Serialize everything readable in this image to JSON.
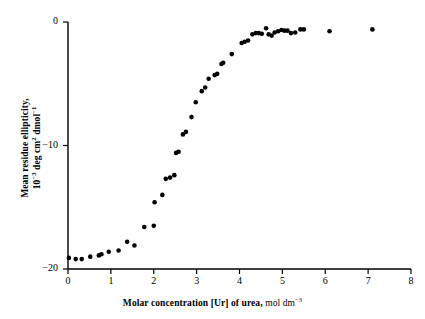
{
  "chart_data": {
    "type": "scatter",
    "title": "",
    "xlabel": "Molar concentration [Ur] of urea, mol dm-3",
    "xlabel_parts": {
      "bold": "Molar concentration [Ur] of urea,",
      "light_pre": " mol dm",
      "light_sup": "−3"
    },
    "ylabel": "Mean residue ellipticity, 10-3 deg cm2 dmol-1",
    "ylabel_parts": {
      "line1": "Mean residue ellipticity,",
      "line2_a": "10",
      "line2_sup1": "−3",
      "line2_b": " deg cm",
      "line2_sup2": "2",
      "line2_c": " dmol",
      "line2_sup3": "−1"
    },
    "xlim": [
      0,
      8
    ],
    "ylim": [
      -20,
      0
    ],
    "xticks": [
      0,
      1,
      2,
      3,
      4,
      5,
      6,
      7,
      8
    ],
    "xtick_labels": [
      "0",
      "1",
      "2",
      "3",
      "4",
      "5",
      "6",
      "7",
      "8"
    ],
    "yticks": [
      0,
      -10,
      -20
    ],
    "ytick_labels": [
      "0",
      "−10",
      "−20"
    ],
    "grid": false,
    "legend": null,
    "marker": {
      "shape": "circle",
      "color": "#000000",
      "size_px": 4.6
    },
    "axis_color": "#000000",
    "series": [
      {
        "name": "Mean residue ellipticity vs urea concentration",
        "points": [
          [
            0.02,
            -19.1
          ],
          [
            0.18,
            -19.2
          ],
          [
            0.32,
            -19.2
          ],
          [
            0.52,
            -19.0
          ],
          [
            0.72,
            -18.9
          ],
          [
            0.78,
            -18.8
          ],
          [
            0.95,
            -18.6
          ],
          [
            1.18,
            -18.5
          ],
          [
            1.38,
            -17.8
          ],
          [
            1.55,
            -18.1
          ],
          [
            1.78,
            -16.6
          ],
          [
            2.0,
            -16.5
          ],
          [
            2.02,
            -14.6
          ],
          [
            2.2,
            -14.0
          ],
          [
            2.28,
            -12.7
          ],
          [
            2.38,
            -12.6
          ],
          [
            2.48,
            -12.4
          ],
          [
            2.52,
            -10.6
          ],
          [
            2.58,
            -10.5
          ],
          [
            2.68,
            -9.1
          ],
          [
            2.75,
            -8.9
          ],
          [
            2.88,
            -7.7
          ],
          [
            2.98,
            -6.5
          ],
          [
            3.12,
            -5.6
          ],
          [
            3.2,
            -5.3
          ],
          [
            3.28,
            -4.6
          ],
          [
            3.42,
            -4.3
          ],
          [
            3.48,
            -4.2
          ],
          [
            3.58,
            -3.4
          ],
          [
            3.62,
            -3.3
          ],
          [
            3.82,
            -2.6
          ],
          [
            4.05,
            -1.7
          ],
          [
            4.12,
            -1.6
          ],
          [
            4.2,
            -1.5
          ],
          [
            4.3,
            -1.0
          ],
          [
            4.38,
            -0.9
          ],
          [
            4.45,
            -0.9
          ],
          [
            4.52,
            -0.95
          ],
          [
            4.62,
            -0.5
          ],
          [
            4.68,
            -1.0
          ],
          [
            4.75,
            -1.1
          ],
          [
            4.82,
            -0.85
          ],
          [
            4.9,
            -0.75
          ],
          [
            4.98,
            -0.65
          ],
          [
            5.05,
            -0.7
          ],
          [
            5.12,
            -0.7
          ],
          [
            5.2,
            -0.9
          ],
          [
            5.3,
            -0.85
          ],
          [
            5.42,
            -0.6
          ],
          [
            5.5,
            -0.6
          ],
          [
            6.1,
            -0.75
          ],
          [
            7.1,
            -0.6
          ]
        ]
      }
    ]
  },
  "axes": {
    "x_axis_name": "x-axis",
    "y_axis_name": "y-axis"
  }
}
